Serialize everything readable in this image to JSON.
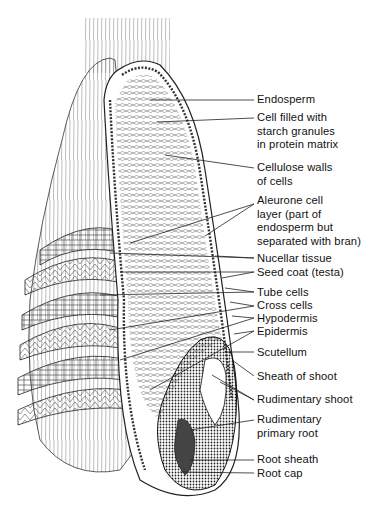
{
  "figure": {
    "labels": [
      {
        "id": "endosperm",
        "text": "Endosperm",
        "top": 93
      },
      {
        "id": "cell-filled",
        "text": "Cell filled with\nstarch granules\nin protein matrix",
        "top": 111
      },
      {
        "id": "cellulose-walls",
        "text": "Cellulose walls\nof cells",
        "top": 161
      },
      {
        "id": "aleurone",
        "text": "Aleurone cell\nlayer (part of\nendosperm but\nseparated with bran)",
        "top": 194
      },
      {
        "id": "nucellar",
        "text": "Nucellar tissue",
        "top": 252
      },
      {
        "id": "seed-coat",
        "text": "Seed coat (testa)",
        "top": 266
      },
      {
        "id": "tube-cells",
        "text": "Tube cells",
        "top": 286
      },
      {
        "id": "cross-cells",
        "text": "Cross cells",
        "top": 299
      },
      {
        "id": "hypodermis",
        "text": "Hypodermis",
        "top": 312
      },
      {
        "id": "epidermis",
        "text": "Epidermis",
        "top": 325
      },
      {
        "id": "scutellum",
        "text": "Scutellum",
        "top": 346
      },
      {
        "id": "sheath-of-shoot",
        "text": "Sheath of shoot",
        "top": 370
      },
      {
        "id": "rudimentary-shoot",
        "text": "Rudimentary shoot",
        "top": 393
      },
      {
        "id": "rudimentary-root",
        "text": "Rudimentary\nprimary root",
        "top": 413
      },
      {
        "id": "root-sheath",
        "text": "Root sheath",
        "top": 453
      },
      {
        "id": "root-cap",
        "text": "Root cap",
        "top": 467
      }
    ]
  }
}
